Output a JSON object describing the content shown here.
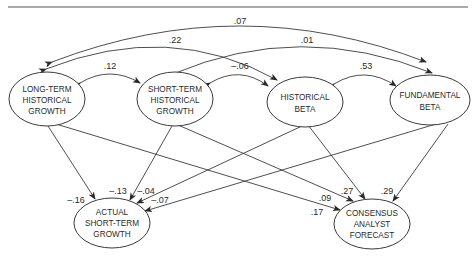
{
  "header_partial_text": "",
  "nodes": {
    "lt": {
      "lines": [
        "LONG-TERM",
        "HISTORICAL",
        "GROWTH"
      ]
    },
    "st": {
      "lines": [
        "SHORT-TERM",
        "HISTORICAL",
        "GROWTH"
      ]
    },
    "hb": {
      "lines": [
        "HISTORICAL",
        "BETA"
      ]
    },
    "fb": {
      "lines": [
        "FUNDAMENTAL",
        "BETA"
      ]
    },
    "ag": {
      "lines": [
        "ACTUAL",
        "SHORT-TERM",
        "GROWTH"
      ]
    },
    "cf": {
      "lines": [
        "CONSENSUS",
        "ANALYST",
        "FORECAST"
      ]
    }
  },
  "correlations": {
    "lt_fb": ".07",
    "lt_hb": ".22",
    "st_fb": ".01",
    "lt_st": ".12",
    "st_hb": "–.06",
    "hb_fb": ".53"
  },
  "paths": {
    "lt_ag": "–.16",
    "st_ag": "–.13",
    "hb_ag": "–.04",
    "fb_ag": "–.07",
    "lt_cf": ".17",
    "st_cf": ".09",
    "hb_cf": ".27",
    "fb_cf": ".29"
  }
}
